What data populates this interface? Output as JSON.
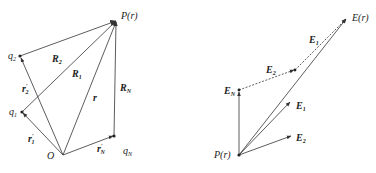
{
  "left_diagram": {
    "points": {
      "origin": {
        "label": "O",
        "x": 63,
        "y": 155
      },
      "q1": {
        "label": "q",
        "sub": "1",
        "x": 22,
        "y": 112
      },
      "q2": {
        "label": "q",
        "sub": "2",
        "x": 20,
        "y": 56
      },
      "qN": {
        "label": "q",
        "sub": "N",
        "x": 114,
        "y": 136
      },
      "P": {
        "label": "P(r)",
        "x": 117,
        "y": 20
      }
    },
    "vectors": {
      "r1_prime": {
        "label": "r",
        "sup": "′",
        "sub": "1"
      },
      "r2_prime": {
        "label": "r",
        "sup": "′",
        "sub": "2"
      },
      "rN_prime": {
        "label": "r",
        "sup": "′",
        "sub": "N"
      },
      "r": {
        "label": "r"
      },
      "R1": {
        "label": "R",
        "sub": "1"
      },
      "R2": {
        "label": "R",
        "sub": "2"
      },
      "RN": {
        "label": "R",
        "sub": "N"
      }
    }
  },
  "right_diagram": {
    "points": {
      "P": {
        "label": "P(r)",
        "x": 239,
        "y": 155
      },
      "EN_tip": {
        "x": 239,
        "y": 90
      },
      "E2_chain_tip": {
        "x": 295,
        "y": 70
      },
      "E_total": {
        "label": "E(r)",
        "x": 347,
        "y": 18
      },
      "E1_tip": {
        "x": 291,
        "y": 101
      },
      "E2_tip": {
        "x": 292,
        "y": 136
      }
    },
    "vectors": {
      "EN": {
        "label": "E",
        "sub": "N"
      },
      "E2_chain": {
        "label": "E",
        "sub": "2"
      },
      "E1_chain": {
        "label": "E",
        "sub": "1"
      },
      "E1": {
        "label": "E",
        "sub": "1"
      },
      "E2": {
        "label": "E",
        "sub": "2"
      },
      "E_total": {
        "label": "E(r)"
      }
    }
  },
  "colors": {
    "stroke": "#333333",
    "text": "#222222",
    "background": "#ffffff"
  }
}
